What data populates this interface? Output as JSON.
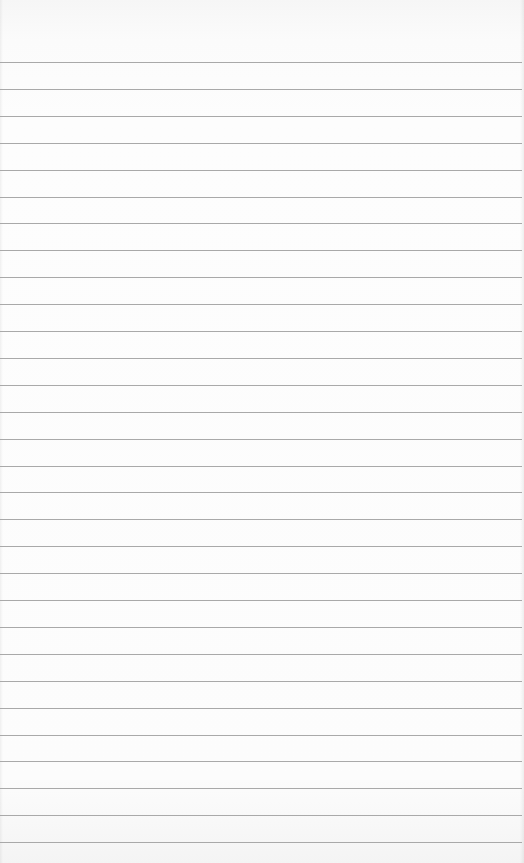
{
  "page": {
    "type": "blank-lined-paper",
    "background_color": "#fcfcfc",
    "line_color": "#a9a9a9",
    "line_count": 30,
    "first_line_y": 62,
    "line_spacing": 26.9,
    "content_text": ""
  }
}
